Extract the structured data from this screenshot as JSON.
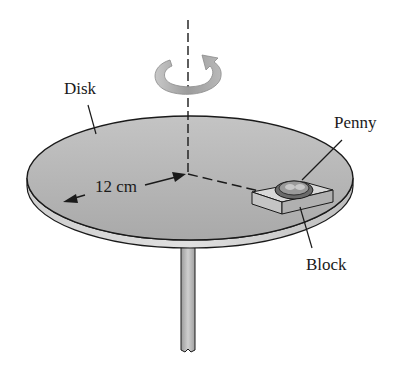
{
  "labels": {
    "disk": "Disk",
    "penny": "Penny",
    "block": "Block",
    "radius": "12 cm"
  },
  "icons": {
    "rotation": "rotation-arrow-icon"
  },
  "colors": {
    "disk_top": "#b5b5b5",
    "disk_edge": "#d2d2d2",
    "outline": "#1a1a1a",
    "arrow": "#a8a8a8"
  }
}
